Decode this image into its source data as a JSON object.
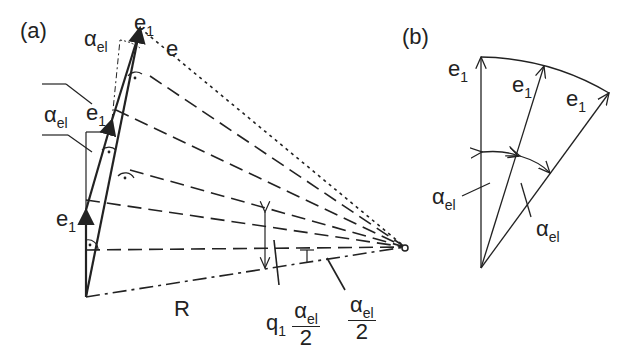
{
  "panels": {
    "a": {
      "label": "(a)",
      "vector_e": "e",
      "vector_e1": "e",
      "sub_1": "1",
      "alpha": "α",
      "alpha_sub": "el",
      "radius": "R",
      "q": "q",
      "q_sub": "1",
      "two": "2"
    },
    "b": {
      "label": "(b)",
      "vector_e1": "e",
      "sub_1": "1",
      "alpha": "α",
      "alpha_sub": "el"
    }
  },
  "colors": {
    "ink": "#222222",
    "background": "#ffffff"
  }
}
